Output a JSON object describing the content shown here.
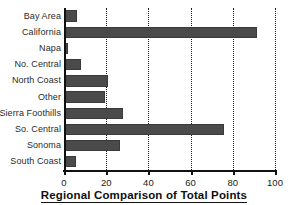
{
  "chart_data": {
    "type": "bar",
    "orientation": "horizontal",
    "title": "Regional Comparison of Total Points",
    "xlabel": "",
    "ylabel": "",
    "xlim": [
      0,
      100
    ],
    "xticks": [
      0,
      20,
      40,
      60,
      80,
      100
    ],
    "xtick_labels": [
      "0",
      "20",
      "40",
      "60",
      "80",
      "100"
    ],
    "grid": "vertical-dotted",
    "legend": "none",
    "bar_color": "#4a4a4a",
    "axis_color": "#111111",
    "categories": [
      "Bay Area",
      "California",
      "Napa",
      "No. Central",
      "North Coast",
      "Other",
      "Sierra Foothills",
      "So. Central",
      "Sonoma",
      "South Coast"
    ],
    "values": [
      6,
      91.5,
      2,
      8,
      21,
      19.5,
      28,
      76,
      26.5,
      5.5
    ]
  }
}
